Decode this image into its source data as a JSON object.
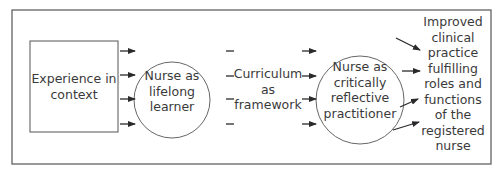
{
  "diagram": {
    "nodes": [
      {
        "id": "experience",
        "shape": "rectangle",
        "label": "Experience in\ncontext"
      },
      {
        "id": "lifelong",
        "shape": "circle",
        "label": "Nurse as\nlifelong\nlearner"
      },
      {
        "id": "curriculum",
        "shape": "text",
        "label": "Curriculum\nas\nframework"
      },
      {
        "id": "reflective",
        "shape": "circle",
        "label": "Nurse as\ncritically\nreflective\npractitioner"
      },
      {
        "id": "outcome",
        "shape": "text",
        "label": "Improved\nclinical\npractice\nfulfilling\nroles and\nfunctions\nof the\nregistered\nnurse"
      }
    ],
    "edges": [
      {
        "from": "experience",
        "to": "lifelong",
        "count": 4,
        "style": "arrow"
      },
      {
        "from": "lifelong",
        "to": "curriculum",
        "count": 4,
        "style": "dash"
      },
      {
        "from": "curriculum",
        "to": "reflective",
        "count": 4,
        "style": "arrow"
      },
      {
        "from": "reflective",
        "to": "outcome",
        "count": 4,
        "style": "arrow"
      }
    ],
    "colors": {
      "stroke": "#3a3a3a",
      "frame": "#555555",
      "background": "#ffffff"
    }
  }
}
